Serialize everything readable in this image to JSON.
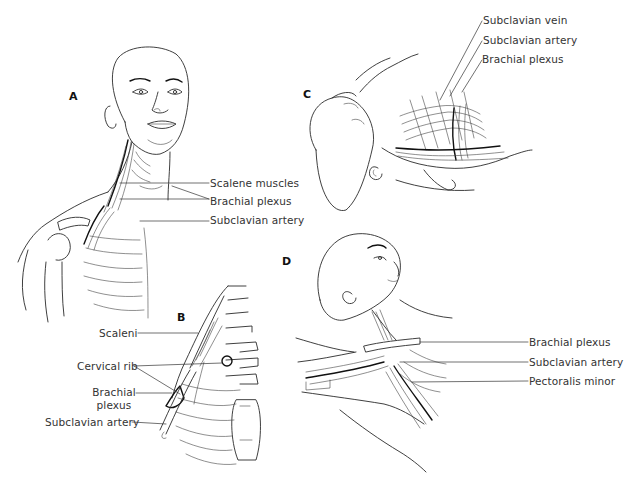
{
  "figure": {
    "panels": [
      {
        "id": "A",
        "letter": "A",
        "description": "Frontal view of head and neck showing scalene muscles, brachial plexus and subclavian artery",
        "labels": [
          "Scalene muscles",
          "Brachial plexus",
          "Subclavian artery"
        ]
      },
      {
        "id": "B",
        "letter": "B",
        "description": "Detail of thoracic outlet with cervical rib",
        "labels": [
          "Scaleni",
          "Cervical rib",
          "Brachial plexus",
          "Subclavian artery"
        ]
      },
      {
        "id": "C",
        "letter": "C",
        "description": "Head turned with neck extended, showing subclavian vessels and brachial plexus",
        "labels": [
          "Subclavian vein",
          "Subclavian artery",
          "Brachial plexus"
        ]
      },
      {
        "id": "D",
        "letter": "D",
        "description": "Arm hyperabducted showing neurovascular bundle under pectoralis minor",
        "labels": [
          "Brachial plexus",
          "Subclavian artery",
          "Pectoralis minor"
        ]
      }
    ]
  },
  "panel_a": {
    "letter": "A",
    "scalene_muscles": "Scalene muscles",
    "brachial_plexus": "Brachial plexus",
    "subclavian_artery": "Subclavian artery"
  },
  "panel_b": {
    "letter": "B",
    "scaleni": "Scaleni",
    "cervical_rib": "Cervical rib",
    "brachial_plexus_line1": "Brachial",
    "brachial_plexus_line2": "plexus",
    "subclavian_artery": "Subclavian artery"
  },
  "panel_c": {
    "letter": "C",
    "subclavian_vein": "Subclavian vein",
    "subclavian_artery": "Subclavian artery",
    "brachial_plexus": "Brachial plexus"
  },
  "panel_d": {
    "letter": "D",
    "brachial_plexus": "Brachial plexus",
    "subclavian_artery": "Subclavian artery",
    "pectoralis_minor": "Pectoralis minor"
  }
}
